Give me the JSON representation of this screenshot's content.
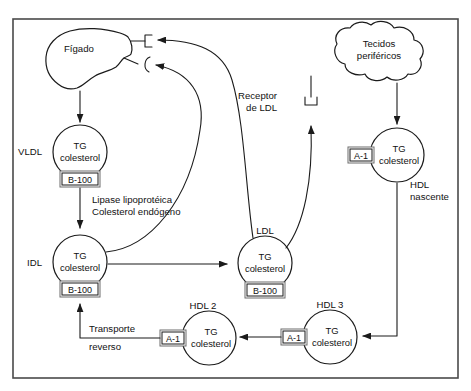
{
  "figure": {
    "language": "pt-BR",
    "background_color": "#ffffff",
    "line_color": "#1b1b1b",
    "frame_color": "#4a4a4a"
  },
  "organs": {
    "liver": {
      "label": "Fígado",
      "shape": "liver-blob",
      "receptors": [
        {
          "name": "remnant-receptor",
          "glyph": "square-bracket"
        },
        {
          "name": "ldl-receptor-liver",
          "glyph": "curved-bracket"
        }
      ]
    },
    "tissues": {
      "label_line1": "Tecidos",
      "label_line2": "periféricos",
      "shape": "cloud"
    }
  },
  "receptor_labels": {
    "ldl_receptor_line1": "Receptor",
    "ldl_receptor_line2": "de LDL"
  },
  "particles": [
    {
      "id": "vldl",
      "name": "VLDL",
      "name_position": "left",
      "core_line1": "TG",
      "core_line2": "colesterol",
      "apo": "B-100",
      "apo_position": "bottom"
    },
    {
      "id": "idl",
      "name": "IDL",
      "name_position": "left",
      "core_line1": "TG",
      "core_line2": "colesterol",
      "apo": "B-100",
      "apo_position": "bottom"
    },
    {
      "id": "ldl",
      "name": "LDL",
      "name_position": "top",
      "core_line1": "TG",
      "core_line2": "colesterol",
      "apo": "B-100",
      "apo_position": "bottom"
    },
    {
      "id": "hdl-nascente",
      "name_line1": "HDL",
      "name_line2": "nascente",
      "name_position": "below",
      "core_line1": "TG",
      "core_line2": "colesterol",
      "apo": "A-1",
      "apo_position": "left"
    },
    {
      "id": "hdl-2",
      "name": "HDL 2",
      "name_position": "top",
      "core_line1": "TG",
      "core_line2": "colesterol",
      "apo": "A-1",
      "apo_position": "left"
    },
    {
      "id": "hdl-3",
      "name": "HDL 3",
      "name_position": "top",
      "core_line1": "TG",
      "core_line2": "colesterol",
      "apo": "A-1",
      "apo_position": "left"
    }
  ],
  "process_labels": {
    "lipase_line1": "Lipase lipoprotéica",
    "lipase_line2": "Colesterol endógeno",
    "reverse_line1": "Transporte",
    "reverse_line2": "reverso"
  },
  "arrows": [
    {
      "name": "liver-to-vldl",
      "from": "liver",
      "to": "vldl",
      "style": "straight-down"
    },
    {
      "name": "vldl-to-idl",
      "from": "vldl",
      "to": "idl",
      "style": "straight-down"
    },
    {
      "name": "idl-to-ldl",
      "from": "idl",
      "to": "ldl",
      "style": "straight-right"
    },
    {
      "name": "idl-to-liver-receptor",
      "from": "idl",
      "to": "liver-curved-receptor",
      "style": "curve"
    },
    {
      "name": "ldl-to-liver-receptor",
      "from": "ldl",
      "to": "liver-square-receptor",
      "style": "curve"
    },
    {
      "name": "ldl-to-ldl-receptor",
      "from": "ldl",
      "to": "ldl-receptor",
      "style": "curve"
    },
    {
      "name": "tissues-to-hdl-nascente",
      "from": "tissues",
      "to": "hdl-nascente",
      "style": "straight-down"
    },
    {
      "name": "hdl-nascente-to-hdl3",
      "from": "hdl-nascente",
      "to": "hdl-3",
      "style": "elbow-left"
    },
    {
      "name": "hdl3-to-hdl2",
      "from": "hdl-3",
      "to": "hdl-2",
      "style": "straight-left"
    },
    {
      "name": "hdl2-to-idl",
      "from": "hdl-2",
      "to": "idl",
      "style": "elbow-up"
    }
  ]
}
